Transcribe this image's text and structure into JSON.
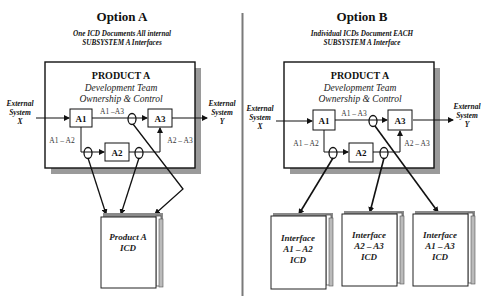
{
  "option_a": {
    "title": "Option A",
    "subtitle_line1": "One ICD Documents All internal",
    "subtitle_line2": "SUBSYSTEM A Interfaces",
    "product": {
      "name": "PRODUCT A",
      "team_line1": "Development Team",
      "team_line2": "Ownership & Control"
    },
    "external_x": [
      "External",
      "System",
      "X"
    ],
    "external_y": [
      "External",
      "System",
      "Y"
    ],
    "nodes": {
      "a1": "A1",
      "a2": "A2",
      "a3": "A3"
    },
    "links": {
      "a1_a3": "A1 –A3",
      "a1_a2": "A1 – A2",
      "a2_a3": "A2 – A3"
    },
    "icd": {
      "line1": "Product A",
      "line2": "ICD"
    }
  },
  "option_b": {
    "title": "Option B",
    "subtitle_line1": "Individual ICDs Document EACH",
    "subtitle_line2": "SUBSYSTEM A Interface",
    "product": {
      "name": "PRODUCT A",
      "team_line1": "Development  Team",
      "team_line2": "Ownership & Control"
    },
    "external_x": [
      "External",
      "System",
      "X"
    ],
    "external_y": [
      "External",
      "System",
      "Y"
    ],
    "nodes": {
      "a1": "A1",
      "a2": "A2",
      "a3": "A3"
    },
    "links": {
      "a1_a3": "A1 – A3",
      "a1_a2": "A1 – A2",
      "a2_a3": "A2 – A3"
    },
    "icds": [
      {
        "line1": "Interface",
        "line2": "A1 – A2",
        "line3": "ICD"
      },
      {
        "line1": "Interface",
        "line2": "A2 – A3",
        "line3": "ICD"
      },
      {
        "line1": "Interface",
        "line2": "A1 – A3",
        "line3": "ICD"
      }
    ]
  },
  "colors": {
    "line": "#111111",
    "shadow": "#9a9a9a",
    "divider": "#7a7a7a",
    "book_spine": "#8a8a8a"
  }
}
